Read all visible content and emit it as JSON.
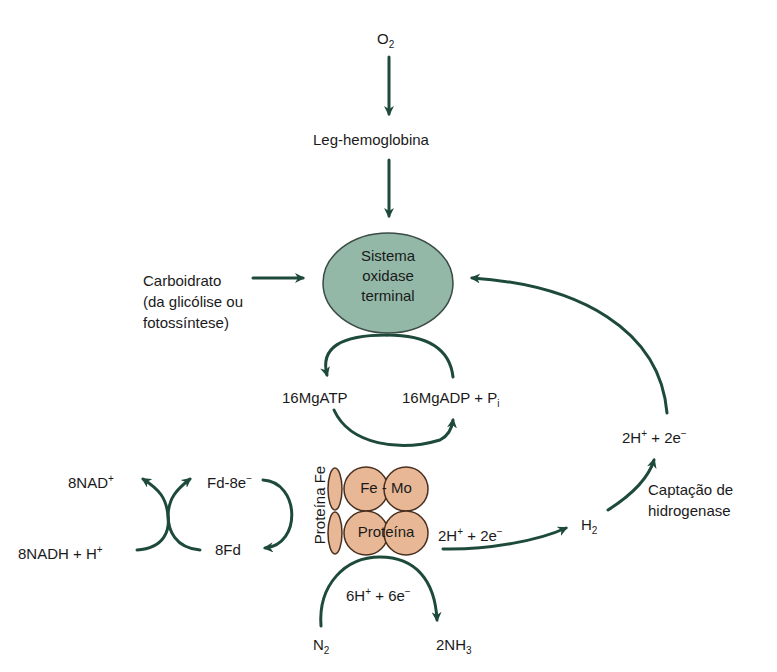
{
  "diagram": {
    "colors": {
      "arrow": "#1e4a3a",
      "oxidase_fill": "#93b8a8",
      "oxidase_stroke": "#3a4a44",
      "protein_fill": "#e8b896",
      "protein_stroke": "#4a3020",
      "text": "#1a1a1a"
    },
    "nodes": {
      "o2": {
        "main": "O",
        "sub": "2"
      },
      "leg_hemoglobina": "Leg-hemoglobina",
      "oxidase": {
        "line1": "Sistema",
        "line2": "oxidase",
        "line3": "terminal"
      },
      "carboidrato": {
        "line1": "Carboidrato",
        "line2": "(da glicólise ou",
        "line3": "fotossíntese)"
      },
      "mgatp": "16MgATP",
      "mgadp": {
        "main": "16MgADP + P",
        "sub": "i"
      },
      "nad": {
        "main": "8NAD",
        "sup": "+"
      },
      "nadh": {
        "main": "8NADH + H",
        "sup": "+"
      },
      "fd_8e": {
        "main": "Fd-8e",
        "sup": "−"
      },
      "fd8": "8Fd",
      "proteina_fe": "Proteína Fe",
      "femo_top": {
        "left": "Fe",
        "sep": "-",
        "right": "Mo"
      },
      "femo_bottom": "Proteína",
      "h_2e_right": {
        "a": "2H",
        "sup1": "+",
        "b": " + 2e",
        "sup2": "−"
      },
      "h2": {
        "main": "H",
        "sub": "2"
      },
      "h_2e_top": {
        "a": "2H",
        "sup1": "+",
        "b": " + 2e",
        "sup2": "−"
      },
      "captacao": {
        "line1": "Captação de",
        "line2": "hidrogenase"
      },
      "h6_6e": {
        "a": "6H",
        "sup1": "+",
        "b": " + 6e",
        "sup2": "−"
      },
      "n2": {
        "main": "N",
        "sub": "2"
      },
      "nh3": {
        "main": "2NH",
        "sub": "3"
      }
    }
  }
}
